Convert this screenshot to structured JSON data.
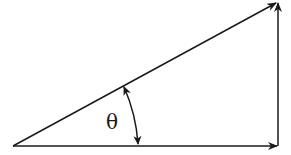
{
  "diagram": {
    "type": "vector-triangle",
    "angle_label": "θ",
    "stroke_color": "#1a1a1a",
    "background": "#ffffff",
    "vectors": [
      {
        "name": "hypotenuse",
        "from": [
          13,
          146
        ],
        "to": [
          276,
          3
        ]
      },
      {
        "name": "horizontal",
        "from": [
          13,
          146
        ],
        "to": [
          277,
          146
        ]
      },
      {
        "name": "vertical",
        "from": [
          278,
          146
        ],
        "to": [
          278,
          2
        ]
      }
    ],
    "angle_arc": {
      "from": [
        124,
        86
      ],
      "to": [
        138,
        145
      ],
      "double_headed": true
    }
  }
}
